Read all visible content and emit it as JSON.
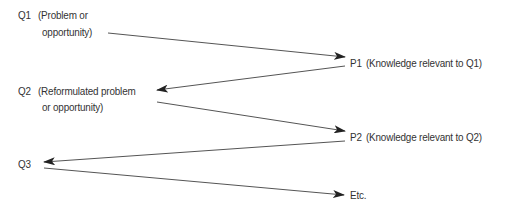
{
  "nodes": {
    "q1": {
      "id": "Q1",
      "line1": "(Problem or",
      "line2": "opportunity)"
    },
    "p1": {
      "id": "P1",
      "text": "(Knowledge relevant to Q1)"
    },
    "q2": {
      "id": "Q2",
      "line1": "(Reformulated problem",
      "line2": "or opportunity)"
    },
    "p2": {
      "id": "P2",
      "text": "(Knowledge relevant to Q2)"
    },
    "q3": {
      "id": "Q3"
    },
    "etc": {
      "text": "Etc."
    }
  },
  "edges": [
    {
      "from": "Q1",
      "to": "P1"
    },
    {
      "from": "P1",
      "to": "Q2"
    },
    {
      "from": "Q2",
      "to": "P2"
    },
    {
      "from": "P2",
      "to": "Q3"
    },
    {
      "from": "Q3",
      "to": "Etc."
    }
  ],
  "colors": {
    "line": "#333333",
    "text": "#333333",
    "background": "#ffffff"
  }
}
